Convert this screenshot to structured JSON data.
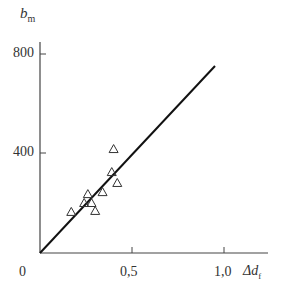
{
  "chart_data": {
    "type": "scatter",
    "title": "",
    "xlabel": "Δd_f",
    "ylabel": "b_m",
    "xlim": [
      0,
      1.2
    ],
    "ylim": [
      0,
      900
    ],
    "x_ticks": [
      "0",
      "0,5",
      "1,0"
    ],
    "y_ticks": [
      "400",
      "800"
    ],
    "grid": false,
    "series": [
      {
        "name": "measurements",
        "marker": "triangle-open",
        "points": [
          [
            0.4,
            420
          ],
          [
            0.39,
            327
          ],
          [
            0.42,
            283
          ],
          [
            0.34,
            246
          ],
          [
            0.26,
            238
          ],
          [
            0.24,
            202
          ],
          [
            0.28,
            202
          ],
          [
            0.3,
            170
          ],
          [
            0.17,
            166
          ]
        ]
      },
      {
        "name": "fit line",
        "type": "line",
        "points": [
          [
            0,
            0
          ],
          [
            0.95,
            755
          ]
        ]
      }
    ]
  },
  "labels": {
    "ylabel_main": "b",
    "ylabel_sub": "m",
    "xlabel_main": "Δd",
    "xlabel_sub": "f",
    "origin": "0",
    "x_tick_05": "0,5",
    "x_tick_10": "1,0",
    "y_tick_400": "400",
    "y_tick_800": "800"
  }
}
